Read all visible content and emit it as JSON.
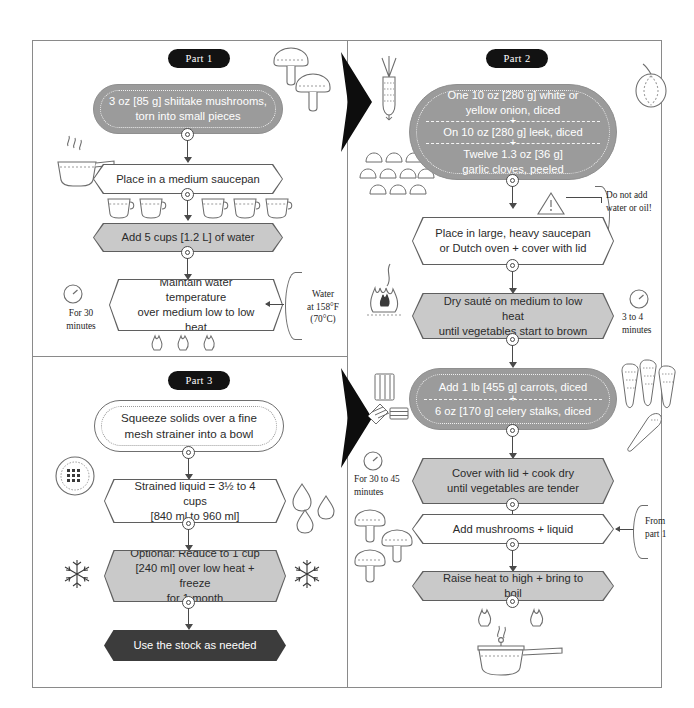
{
  "diagram": {
    "colors": {
      "fill_gray": "#9b9b9b",
      "fill_light": "#c9c9c9",
      "fill_dark": "#3c3c3c",
      "stroke": "#5f5f5f",
      "badge": "#121212"
    }
  },
  "part1": {
    "badge": "Part 1",
    "steps": [
      {
        "id": "p1s1",
        "shape": "pill",
        "text": "3 oz [85 g] shiitake mushrooms,\ntorn into small pieces"
      },
      {
        "id": "p1s2",
        "shape": "hex",
        "text": "Place in a medium saucepan"
      },
      {
        "id": "p1s3",
        "shape": "hex-filled",
        "text": "Add 5 cups [1.2 L] of water"
      },
      {
        "id": "p1s4",
        "shape": "hex",
        "text": "Maintain water temperature\nover medium low to low heat"
      }
    ],
    "annotations": [
      {
        "id": "p1a1",
        "text": "For 30\nminutes",
        "icon": "timer-icon"
      },
      {
        "id": "p1a2",
        "text": "Water\nat 158°F\n(70°C)"
      }
    ],
    "icons": [
      "mushroom-icon",
      "mushroom-icon",
      "steam-icon",
      "saucepan-icon",
      "measuring-cup-icon",
      "flame-icon"
    ]
  },
  "part2": {
    "badge": "Part 2",
    "steps": [
      {
        "id": "p2s1",
        "shape": "pill-multi",
        "lines": [
          "One 10 oz [280 g] white or\nyellow onion, diced",
          "On 10 oz [280 g]  leek, diced",
          "Twelve 1.3 oz [36 g]\ngarlic cloves, peeled"
        ]
      },
      {
        "id": "p2s2",
        "shape": "hex",
        "text": "Place in large, heavy saucepan\nor Dutch oven + cover with lid"
      },
      {
        "id": "p2s3",
        "shape": "hex-filled",
        "text": "Dry sauté on medium to low heat\nuntil vegetables start to brown"
      },
      {
        "id": "p2s4",
        "shape": "pill-multi",
        "lines": [
          "Add 1 lb [455 g] carrots, diced",
          "6 oz [170 g] celery stalks, diced"
        ]
      },
      {
        "id": "p2s5",
        "shape": "hex-filled",
        "text": "Cover with lid + cook dry\nuntil vegetables are tender"
      },
      {
        "id": "p2s6",
        "shape": "hex",
        "text": "Add mushrooms + liquid"
      },
      {
        "id": "p2s7",
        "shape": "hex-filled",
        "text": "Raise heat to high + bring to boil"
      }
    ],
    "annotations": [
      {
        "id": "p2a1",
        "text": "Do not add\nwater or oil!",
        "icon": "warning-triangle-icon"
      },
      {
        "id": "p2a2",
        "text": "3 to 4\nminutes",
        "icon": "timer-icon"
      },
      {
        "id": "p2a3",
        "text": "For 30 to 45\nminutes",
        "icon": "timer-icon"
      },
      {
        "id": "p2a4",
        "text": "From\npart 1"
      }
    ],
    "icons": [
      "leek-icon",
      "onion-icon",
      "garlic-cloves-icon",
      "flame-icon",
      "carrot-icon",
      "celery-icon",
      "mushroom-icon",
      "saucepan-icon"
    ]
  },
  "part3": {
    "badge": "Part 3",
    "steps": [
      {
        "id": "p3s1",
        "shape": "pill-outline",
        "text": "Squeeze solids over a fine\nmesh strainer into a bowl"
      },
      {
        "id": "p3s2",
        "shape": "hex",
        "text": "Strained liquid = 3½ to 4 cups\n[840 ml to 960 ml]"
      },
      {
        "id": "p3s3",
        "shape": "hex-filled",
        "text": "Optional: Reduce to 1 cup\n[240 ml] over low heat + freeze\nfor 1 month"
      },
      {
        "id": "p3s4",
        "shape": "hex-dark",
        "text": "Use the stock as needed"
      }
    ],
    "icons": [
      "strainer-icon",
      "water-drop-icon",
      "snowflake-icon",
      "snowflake-icon"
    ]
  }
}
